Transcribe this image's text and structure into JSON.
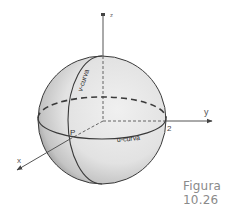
{
  "figure": {
    "caption": "Figura 10.26",
    "axes": {
      "x_label": "x",
      "y_label": "y",
      "z_label": "z"
    },
    "labels": {
      "point": "P",
      "radius_tick": "2",
      "v_curve": "v-curva",
      "u_curve": "u-curva"
    },
    "colors": {
      "line": "#3a3a3a",
      "sphere_fill": "#e6e6e6",
      "shadow": "#8c8c8c",
      "caption": "#8a8a8a"
    }
  }
}
